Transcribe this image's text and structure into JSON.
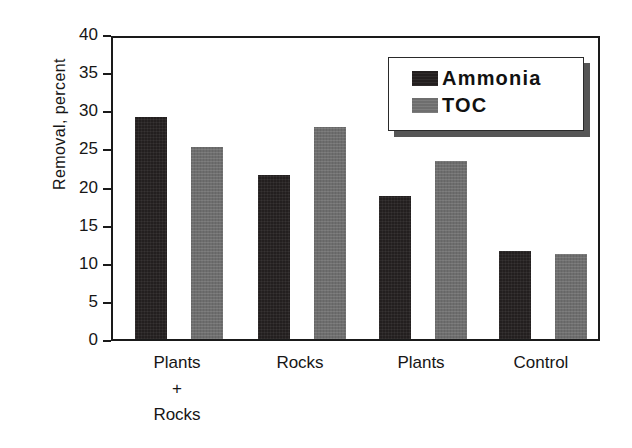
{
  "chart_data": {
    "type": "bar",
    "title": "",
    "xlabel": "",
    "ylabel": "Removal, percent",
    "ylim": [
      0,
      40
    ],
    "yticks": [
      0,
      5,
      10,
      15,
      20,
      25,
      30,
      35,
      40
    ],
    "ytick_labels": [
      "0",
      "5",
      "10",
      "15",
      "20",
      "25",
      "30",
      "35",
      "40"
    ],
    "grid": false,
    "legend_position": "upper right",
    "categories": [
      "Plants + Rocks",
      "Rocks",
      "Plants",
      "Control"
    ],
    "category_label_lines": [
      [
        "Plants",
        "+",
        "Rocks"
      ],
      [
        "Rocks"
      ],
      [
        "Plants"
      ],
      [
        "Control"
      ]
    ],
    "series": [
      {
        "name": "Ammonia",
        "color": "#231f1f",
        "values": [
          29.1,
          21.5,
          18.7,
          11.5
        ]
      },
      {
        "name": "TOC",
        "color": "#6e6e6e",
        "values": [
          25.2,
          27.8,
          23.3,
          11.1
        ]
      }
    ]
  },
  "legend": {
    "entries": [
      {
        "label": "Ammonia",
        "swatch": "ammonia"
      },
      {
        "label": "TOC",
        "swatch": "toc"
      }
    ]
  },
  "colors": {
    "ammonia": "#231f1f",
    "toc": "#6e6e6e",
    "axis": "#1a1a1a",
    "background": "#ffffff"
  }
}
